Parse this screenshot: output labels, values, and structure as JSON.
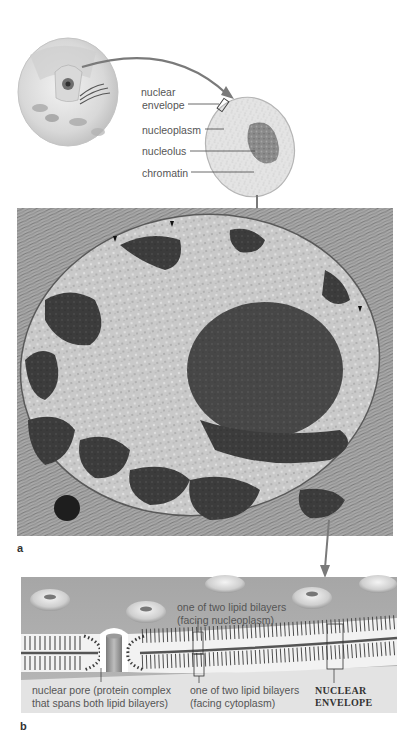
{
  "figure": {
    "top_illustration": {
      "cell_name": "animal-cell-cutaway",
      "nucleus_name": "nucleus-closeup",
      "labels": [
        {
          "id": "nuclear-envelope",
          "text_line1": "nuclear",
          "text_line2": "envelope"
        },
        {
          "id": "nucleoplasm",
          "text": "nucleoplasm"
        },
        {
          "id": "nucleolus",
          "text": "nucleolus"
        },
        {
          "id": "chromatin",
          "text": "chromatin"
        }
      ]
    },
    "panel_a": {
      "letter": "a",
      "content": "electron-micrograph-of-nucleus"
    },
    "panel_b": {
      "letter": "b",
      "labels": {
        "bilayer_nucleoplasm_line1": "one of two lipid bilayers",
        "bilayer_nucleoplasm_line2": "(facing nucleoplasm)",
        "pore_line1": "nuclear pore (protein complex",
        "pore_line2": "that spans both lipid bilayers)",
        "bilayer_cytoplasm_line1": "one of two lipid bilayers",
        "bilayer_cytoplasm_line2": "(facing cytoplasm)",
        "envelope_line1": "NUCLEAR",
        "envelope_line2": "ENVELOPE"
      }
    },
    "colors": {
      "arrow": "#7a7a7a",
      "leader_line": "#444444",
      "membrane_bg": "#b0b0b0",
      "cytoplasm_bg": "#e6e6e6",
      "micrograph_dark": "#3a3a3a",
      "micrograph_light": "#cfcfcf"
    }
  }
}
